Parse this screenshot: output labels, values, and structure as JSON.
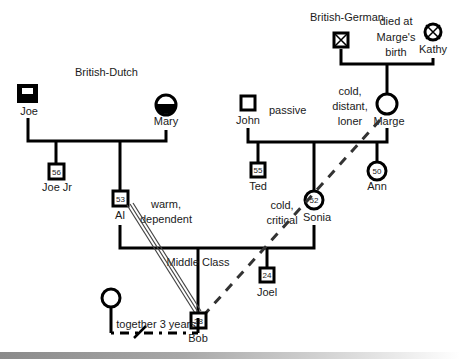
{
  "diagram": {
    "type": "genogram",
    "annotations": {
      "family_left": "British-Dutch",
      "family_right": "British-German",
      "kathy_note": [
        "died at",
        "Marge's",
        "birth"
      ],
      "john_trait": "passive",
      "marge_traits": [
        "cold,",
        "distant,",
        "loner"
      ],
      "al_traits": [
        "warm,",
        "dependent"
      ],
      "sonia_traits": [
        "cold,",
        "critical"
      ],
      "class_label": "Middle Class",
      "bob_relationship": "together 3 years"
    },
    "people": {
      "joe": {
        "name": "Joe",
        "sex": "male",
        "marker": "filled-with-window"
      },
      "mary": {
        "name": "Mary",
        "sex": "female",
        "marker": "bottom-half-filled"
      },
      "bg_father": {
        "name": "",
        "sex": "male",
        "marker": "deceased-x"
      },
      "kathy": {
        "name": "Kathy",
        "sex": "female",
        "marker": "deceased-x"
      },
      "john": {
        "name": "John",
        "sex": "male"
      },
      "marge": {
        "name": "Marge",
        "sex": "female"
      },
      "joe_jr": {
        "name": "Joe Jr",
        "sex": "male",
        "age": "56"
      },
      "al": {
        "name": "Al",
        "sex": "male",
        "age": "53"
      },
      "ted": {
        "name": "Ted",
        "sex": "male",
        "age": "55"
      },
      "sonia": {
        "name": "Sonia",
        "sex": "female",
        "age": "52"
      },
      "ann": {
        "name": "Ann",
        "sex": "female",
        "age": "50"
      },
      "bob": {
        "name": "Bob",
        "sex": "male",
        "age": "28"
      },
      "joel": {
        "name": "Joel",
        "sex": "male",
        "age": "24"
      },
      "partner": {
        "name": "",
        "sex": "female"
      }
    },
    "relationships": [
      {
        "from": "al",
        "to": "bob",
        "type": "fused (triple line)"
      },
      {
        "from": "marge",
        "to": "bob",
        "type": "distant (dashed)"
      },
      {
        "from": "bob",
        "to": "partner",
        "type": "cohabitation / separated",
        "label": "together 3 years"
      }
    ]
  }
}
